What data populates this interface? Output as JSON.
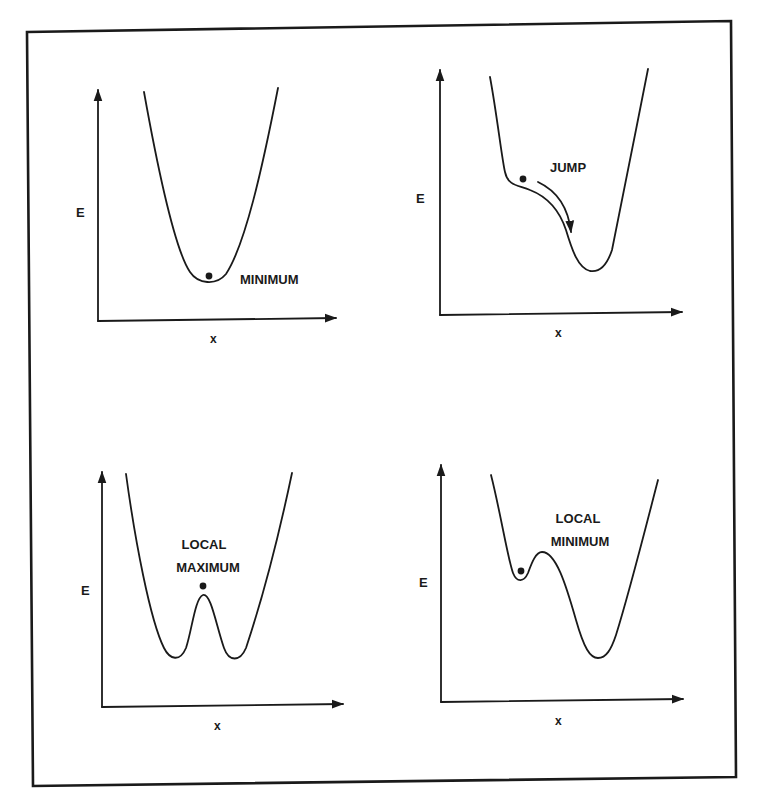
{
  "figure": {
    "panels": [
      {
        "id": "minimum",
        "y_label": "E",
        "x_label": "x",
        "annotation": [
          "MINIMUM"
        ],
        "description": "Single-well potential; ball resting at the minimum"
      },
      {
        "id": "jump",
        "y_label": "E",
        "x_label": "x",
        "annotation": [
          "JUMP"
        ],
        "description": "Ball on a shoulder of the curve, with an arrow indicating it jumps down into the well"
      },
      {
        "id": "local-maximum",
        "y_label": "E",
        "x_label": "x",
        "annotation": [
          "LOCAL",
          "MAXIMUM"
        ],
        "description": "Double-well potential; ball balanced on the central local maximum"
      },
      {
        "id": "local-minimum",
        "y_label": "E",
        "x_label": "x",
        "annotation": [
          "LOCAL",
          "MINIMUM"
        ],
        "description": "Asymmetric double well; ball trapped in the shallow local minimum"
      }
    ]
  },
  "colors": {
    "ink": "#1a1a1a",
    "background": "#ffffff"
  }
}
